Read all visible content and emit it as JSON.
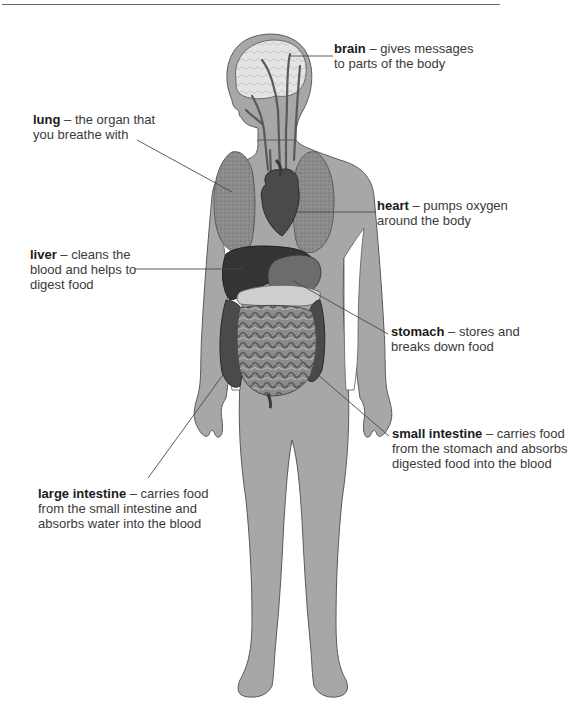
{
  "diagram": {
    "colors": {
      "body_fill": "#a7a7a7",
      "body_outline": "#5a5a5a",
      "organ_dark": "#3c3c3c",
      "organ_mid": "#6e6e6e",
      "organ_light": "#c9c9c9",
      "leader_line": "#4a4a4a",
      "text": "#3a3a3a",
      "rule": "#6a6a6a"
    },
    "labels": [
      {
        "id": "brain",
        "term": "brain",
        "separator": " – ",
        "lines": [
          "gives messages",
          "to parts of the body"
        ]
      },
      {
        "id": "lung",
        "term": "lung",
        "separator": " – ",
        "lines": [
          "the organ that",
          "you breathe with"
        ]
      },
      {
        "id": "heart",
        "term": "heart",
        "separator": " – ",
        "lines": [
          "pumps oxygen",
          "around the body"
        ]
      },
      {
        "id": "liver",
        "term": "liver",
        "separator": " – ",
        "lines": [
          "cleans the",
          "blood and helps to",
          "digest food"
        ]
      },
      {
        "id": "stomach",
        "term": "stomach",
        "separator": " – ",
        "lines": [
          "stores and",
          "breaks down food"
        ]
      },
      {
        "id": "small_intestine",
        "term": "small intestine",
        "separator": " – ",
        "lines": [
          "carries food",
          "from the stomach and absorbs",
          "digested food into the blood"
        ]
      },
      {
        "id": "large_intestine",
        "term": "large intestine",
        "separator": " – ",
        "lines": [
          "carries food",
          "from the small intestine and",
          "absorbs water into the blood"
        ]
      }
    ]
  }
}
